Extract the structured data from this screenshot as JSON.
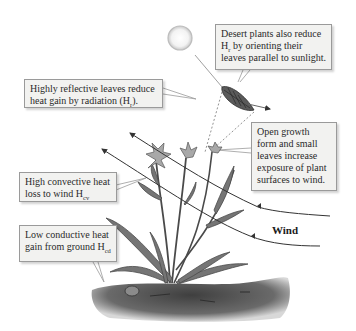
{
  "diagram": {
    "callouts": [
      {
        "id": "leaf-orientation",
        "text": "Desert plants also reduce H",
        "sub": "r",
        "text_after": " by orienting their leaves parallel to sunlight."
      },
      {
        "id": "reflective-leaves",
        "text": "Highly reflective leaves reduce heat gain by radiation (H",
        "sub": "r",
        "text_after": ")."
      },
      {
        "id": "open-growth",
        "text": "Open growth form and small leaves increase exposure of plant surfaces to wind."
      },
      {
        "id": "convective",
        "text": "High convective heat loss to wind H",
        "sub": "cv",
        "text_after": ""
      },
      {
        "id": "conductive",
        "text": "Low conductive heat gain from ground H",
        "sub": "cd",
        "text_after": ""
      }
    ],
    "wind_label": "Wind",
    "colors": {
      "box_fill": "#f2f2f0",
      "box_border": "#9a9a9a",
      "plant": "#6d6d6d",
      "ground": "#5a5a5a",
      "arrow": "#444444",
      "sun": "#e8e8e8"
    }
  }
}
